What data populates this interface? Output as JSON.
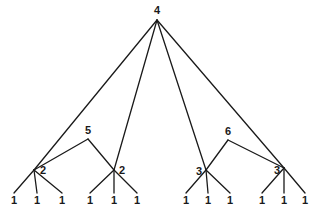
{
  "diagram": {
    "type": "tree",
    "nodes": [
      {
        "id": "root",
        "label": "4",
        "x": 157,
        "y": 20,
        "lx": 157,
        "ly": 14,
        "anchor": "middle"
      },
      {
        "id": "m5",
        "label": "5",
        "x": 88,
        "y": 139,
        "lx": 88,
        "ly": 134,
        "anchor": "middle"
      },
      {
        "id": "m6",
        "label": "6",
        "x": 228,
        "y": 140,
        "lx": 228,
        "ly": 135,
        "anchor": "middle"
      },
      {
        "id": "a",
        "label": "2",
        "x": 34,
        "y": 170,
        "lx": 40,
        "ly": 174,
        "anchor": "start"
      },
      {
        "id": "b",
        "label": "2",
        "x": 114,
        "y": 170,
        "lx": 119,
        "ly": 174,
        "anchor": "start"
      },
      {
        "id": "c",
        "label": "3",
        "x": 206,
        "y": 170,
        "lx": 202,
        "ly": 175,
        "anchor": "end"
      },
      {
        "id": "d",
        "label": "3",
        "x": 284,
        "y": 168,
        "lx": 280,
        "ly": 174,
        "anchor": "end"
      },
      {
        "id": "a1",
        "label": "1",
        "x": 14,
        "y": 193,
        "lx": 14,
        "ly": 204,
        "anchor": "middle"
      },
      {
        "id": "a2",
        "label": "1",
        "x": 37,
        "y": 193,
        "lx": 37,
        "ly": 204,
        "anchor": "middle"
      },
      {
        "id": "a3",
        "label": "1",
        "x": 62,
        "y": 193,
        "lx": 62,
        "ly": 204,
        "anchor": "middle"
      },
      {
        "id": "b1",
        "label": "1",
        "x": 90,
        "y": 193,
        "lx": 90,
        "ly": 204,
        "anchor": "middle"
      },
      {
        "id": "b2",
        "label": "1",
        "x": 114,
        "y": 193,
        "lx": 114,
        "ly": 204,
        "anchor": "middle"
      },
      {
        "id": "b3",
        "label": "1",
        "x": 137,
        "y": 193,
        "lx": 137,
        "ly": 204,
        "anchor": "middle"
      },
      {
        "id": "c1",
        "label": "1",
        "x": 186,
        "y": 193,
        "lx": 186,
        "ly": 204,
        "anchor": "middle"
      },
      {
        "id": "c2",
        "label": "1",
        "x": 208,
        "y": 193,
        "lx": 208,
        "ly": 204,
        "anchor": "middle"
      },
      {
        "id": "c3",
        "label": "1",
        "x": 230,
        "y": 193,
        "lx": 230,
        "ly": 204,
        "anchor": "middle"
      },
      {
        "id": "d1",
        "label": "1",
        "x": 262,
        "y": 193,
        "lx": 262,
        "ly": 204,
        "anchor": "middle"
      },
      {
        "id": "d2",
        "label": "1",
        "x": 284,
        "y": 193,
        "lx": 284,
        "ly": 204,
        "anchor": "middle"
      },
      {
        "id": "d3",
        "label": "1",
        "x": 305,
        "y": 193,
        "lx": 305,
        "ly": 204,
        "anchor": "middle"
      }
    ],
    "edges": [
      [
        "root",
        "a"
      ],
      [
        "root",
        "b"
      ],
      [
        "root",
        "c"
      ],
      [
        "root",
        "d"
      ],
      [
        "m5",
        "a"
      ],
      [
        "m5",
        "b"
      ],
      [
        "m6",
        "c"
      ],
      [
        "m6",
        "d"
      ],
      [
        "a",
        "a1"
      ],
      [
        "a",
        "a2"
      ],
      [
        "a",
        "a3"
      ],
      [
        "b",
        "b1"
      ],
      [
        "b",
        "b2"
      ],
      [
        "b",
        "b3"
      ],
      [
        "c",
        "c1"
      ],
      [
        "c",
        "c2"
      ],
      [
        "c",
        "c3"
      ],
      [
        "d",
        "d1"
      ],
      [
        "d",
        "d2"
      ],
      [
        "d",
        "d3"
      ]
    ]
  }
}
